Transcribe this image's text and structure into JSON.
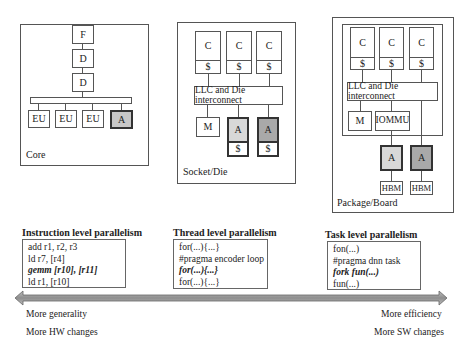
{
  "core": {
    "label": "Core",
    "fetch": "F",
    "decode1": "D",
    "decode2": "D",
    "units": [
      "EU",
      "EU",
      "EU"
    ],
    "accelerator": "A"
  },
  "socket": {
    "label": "Socket/Die",
    "cores": [
      {
        "core": "C",
        "cache": "$"
      },
      {
        "core": "C",
        "cache": "$"
      },
      {
        "core": "C",
        "cache": "$"
      }
    ],
    "interconnect": "LLC and Die interconnect",
    "memory": "M",
    "accelerators": [
      {
        "label": "A",
        "cache": "$",
        "shade": "light"
      },
      {
        "label": "A",
        "cache": "$",
        "shade": "dark"
      }
    ]
  },
  "package": {
    "label": "Package/Board",
    "cores": [
      {
        "core": "C",
        "cache": "$"
      },
      {
        "core": "C",
        "cache": "$"
      },
      {
        "core": "C",
        "cache": "$"
      }
    ],
    "interconnect": "LLC and Die interconnect",
    "memory": "M",
    "iommu": "IOMMU",
    "accelerators": [
      {
        "label": "A",
        "mem": "HBM",
        "shade": "light"
      },
      {
        "label": "A",
        "mem": "HBM",
        "shade": "dark"
      }
    ]
  },
  "parallelism": [
    {
      "title": "Instruction level parallelism",
      "lines": [
        {
          "text": "add r1, r2, r3",
          "emph": false
        },
        {
          "text": "ld r7, [r4]",
          "emph": false
        },
        {
          "text": "gemm [r10], [r11]",
          "emph": true
        },
        {
          "text": "ld r1, [r10]",
          "emph": false
        }
      ]
    },
    {
      "title": "Thread level parallelism",
      "lines": [
        {
          "text": "for(...){...}",
          "emph": false
        },
        {
          "text": "#pragma encoder loop",
          "emph": false
        },
        {
          "text": "for(...){...}",
          "emph": true
        },
        {
          "text": "for(...){...}",
          "emph": false
        }
      ]
    },
    {
      "title": "Task level parallelism",
      "lines": [
        {
          "text": "fon(...)",
          "emph": false
        },
        {
          "text": "#pragma dnn task",
          "emph": false
        },
        {
          "text": "fork fun(...)",
          "emph": true
        },
        {
          "text": "fun(...)",
          "emph": false
        }
      ]
    }
  ],
  "axis": {
    "left": [
      "More generality",
      "More HW changes"
    ],
    "right": [
      "More efficiency",
      "More SW changes"
    ]
  },
  "colors": {
    "accelerator_light": "#d8d8d8",
    "accelerator_dark": "#a9a9a9",
    "arrow": "#9a9a9a",
    "stroke": "#555555"
  }
}
